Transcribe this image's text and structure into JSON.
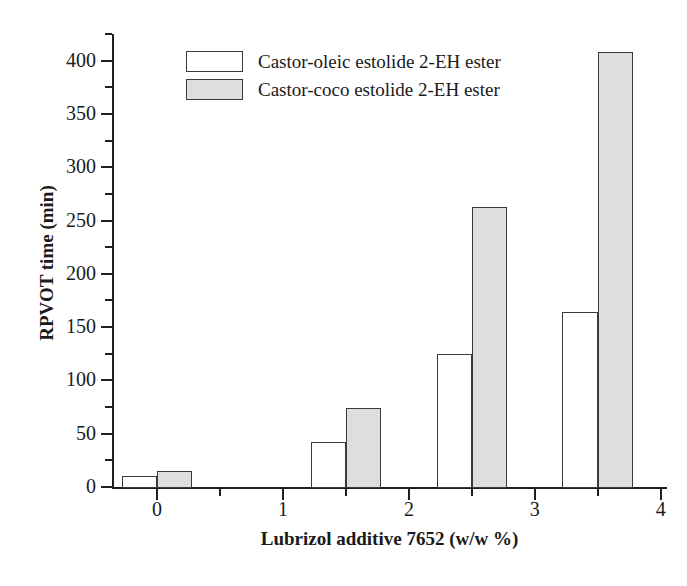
{
  "chart_data": {
    "type": "bar",
    "title": "",
    "subtitle": "",
    "xlabel": "Lubrizol additive 7652 (w/w %)",
    "ylabel": "RPVOT time (min)",
    "categories": [
      "0",
      "1",
      "2",
      "3"
    ],
    "category_x_positions": [
      0.0,
      1.5,
      2.5,
      3.5
    ],
    "series": [
      {
        "name": "Castor-oleic estolide 2-EH ester",
        "color": "#ffffff",
        "edge_color": "#3a3a3a",
        "values": [
          10,
          42,
          125,
          164
        ]
      },
      {
        "name": "Castor-coco estolide 2-EH ester",
        "color": "#dedede",
        "edge_color": "#3a3a3a",
        "values": [
          15,
          74,
          263,
          408
        ]
      }
    ],
    "xlim": [
      -0.35,
      4.05
    ],
    "ylim": [
      0,
      425
    ],
    "y_major_ticks": [
      0,
      50,
      100,
      150,
      200,
      250,
      300,
      350,
      400
    ],
    "y_minor_ticks": [
      25,
      75,
      125,
      175,
      225,
      275,
      325,
      375,
      425
    ],
    "x_major_ticks": [
      0,
      1,
      2,
      3,
      4
    ],
    "x_minor_ticks": [
      -0.5,
      0.5,
      1.5,
      2.5,
      3.5
    ],
    "x_tick_labels": [
      "0",
      "1",
      "2",
      "3",
      "4"
    ],
    "grid": false,
    "legend_position": "top-left-inside"
  },
  "axes": {
    "y_title": "RPVOT time (min)",
    "x_title": "Lubrizol additive 7652 (w/w %)",
    "y_tick_labels": [
      "0",
      "50",
      "100",
      "150",
      "200",
      "250",
      "300",
      "350",
      "400"
    ],
    "x_tick_labels": [
      "0",
      "1",
      "2",
      "3",
      "4"
    ]
  },
  "legend": {
    "entries": [
      {
        "label": "Castor-oleic estolide 2-EH ester",
        "swatch": "open-rectangle-swatch"
      },
      {
        "label": "Castor-coco estolide 2-EH ester",
        "swatch": "filled-gray-rectangle-swatch"
      }
    ]
  }
}
